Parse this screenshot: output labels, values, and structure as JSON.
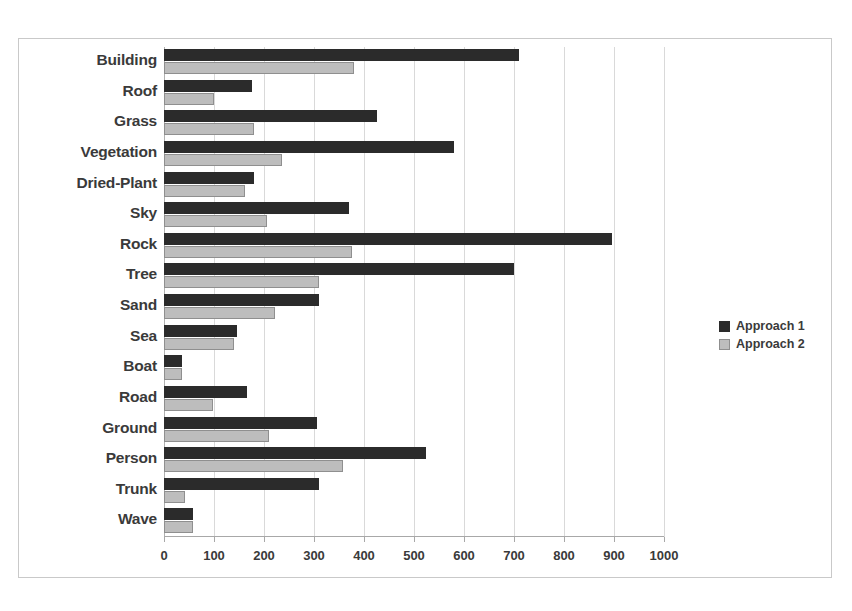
{
  "chart_data": {
    "type": "bar",
    "orientation": "horizontal",
    "title": "",
    "xlabel": "",
    "ylabel": "",
    "xlim": [
      0,
      1000
    ],
    "xticks": [
      0,
      100,
      200,
      300,
      400,
      500,
      600,
      700,
      800,
      900,
      1000
    ],
    "xtick_labels": [
      "0",
      "100",
      "200",
      "300",
      "400",
      "500",
      "600",
      "700",
      "800",
      "900",
      "1000"
    ],
    "grid": true,
    "legend_position": "right",
    "categories": [
      "Building",
      "Roof",
      "Grass",
      "Vegetation",
      "Dried-Plant",
      "Sky",
      "Rock",
      "Tree",
      "Sand",
      "Sea",
      "Boat",
      "Road",
      "Ground",
      "Person",
      "Trunk",
      "Wave"
    ],
    "series": [
      {
        "name": "Approach 1",
        "color": "#2b2b2b",
        "values": [
          710,
          175,
          425,
          580,
          180,
          370,
          895,
          700,
          310,
          145,
          35,
          165,
          305,
          523,
          310,
          58
        ]
      },
      {
        "name": "Approach 2",
        "color": "#bdbdbd",
        "values": [
          380,
          100,
          180,
          235,
          162,
          205,
          375,
          310,
          222,
          140,
          35,
          98,
          210,
          357,
          42,
          58
        ]
      }
    ]
  },
  "legend": {
    "items": [
      {
        "label": "Approach 1"
      },
      {
        "label": "Approach 2"
      }
    ]
  },
  "colors": {
    "series1": "#2b2b2b",
    "series2": "#bdbdbd",
    "grid": "#d9d9d9",
    "frame": "#c9c9c9",
    "text": "#3a3a3a"
  }
}
